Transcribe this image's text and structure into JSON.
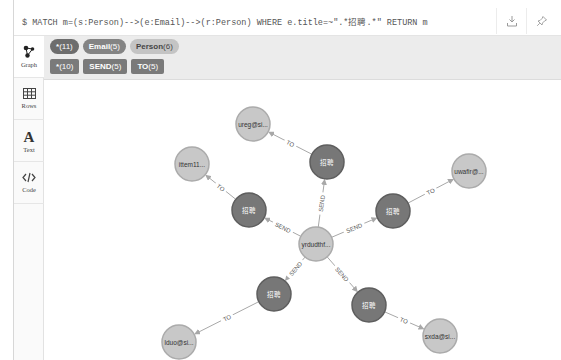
{
  "query": {
    "text": "$ MATCH m=(s:Person)-->(e:Email)-->(r:Person) WHERE e.title=~\".*招聘.*\" RETURN m",
    "buttons": [
      {
        "name": "download",
        "icon": "download-icon"
      },
      {
        "name": "pin",
        "icon": "pin-icon"
      }
    ]
  },
  "sidebar": {
    "items": [
      {
        "label": "Graph",
        "icon": "graph-icon",
        "active": true
      },
      {
        "label": "Rows",
        "icon": "table-icon",
        "active": false
      },
      {
        "label": "Text",
        "icon": "text-icon",
        "active": false
      },
      {
        "label": "Code",
        "icon": "code-icon",
        "active": false
      }
    ]
  },
  "legend": {
    "node_labels": [
      {
        "name": "*",
        "count": "(11)",
        "color": "#6d6d6d",
        "text_color": "#ffffff"
      },
      {
        "name": "Email",
        "count": "(5)",
        "color": "#848484",
        "text_color": "#ffffff"
      },
      {
        "name": "Person",
        "count": "(6)",
        "color": "#c4c4c4",
        "text_color": "#444444"
      }
    ],
    "relationship_types": [
      {
        "name": "*",
        "count": "(10)",
        "color": "#7a7a7a"
      },
      {
        "name": "SEND",
        "count": "(5)",
        "color": "#7a7a7a"
      },
      {
        "name": "TO",
        "count": "(5)",
        "color": "#7a7a7a"
      }
    ]
  },
  "graph": {
    "colors": {
      "person_fill": "#c8c8c8",
      "person_stroke": "#ababab",
      "email_fill": "#777777",
      "email_stroke": "#5e5e5e",
      "edge": "#a8a8a8"
    },
    "nodes": [
      {
        "id": "center",
        "type": "Person",
        "label": "yrdudthf...",
        "x": 272,
        "y": 164,
        "r": 17
      },
      {
        "id": "e1",
        "type": "Email",
        "label": "招聘",
        "x": 283,
        "y": 82,
        "r": 17
      },
      {
        "id": "e2",
        "type": "Email",
        "label": "招聘",
        "x": 205,
        "y": 130,
        "r": 17
      },
      {
        "id": "e3",
        "type": "Email",
        "label": "招聘",
        "x": 349,
        "y": 131,
        "r": 17
      },
      {
        "id": "e4",
        "type": "Email",
        "label": "招聘",
        "x": 230,
        "y": 214,
        "r": 17
      },
      {
        "id": "e5",
        "type": "Email",
        "label": "招聘",
        "x": 325,
        "y": 225,
        "r": 17
      },
      {
        "id": "p1",
        "type": "Person",
        "label": "ureg@si...",
        "x": 209,
        "y": 44,
        "r": 17
      },
      {
        "id": "p2",
        "type": "Person",
        "label": "ittem11...",
        "x": 148,
        "y": 84,
        "r": 17
      },
      {
        "id": "p3",
        "type": "Person",
        "label": "uwafir@...",
        "x": 425,
        "y": 91,
        "r": 17
      },
      {
        "id": "p4",
        "type": "Person",
        "label": "lduo@si...",
        "x": 135,
        "y": 262,
        "r": 17
      },
      {
        "id": "p5",
        "type": "Person",
        "label": "sxda@si...",
        "x": 396,
        "y": 256,
        "r": 17
      }
    ],
    "edges": [
      {
        "from": "center",
        "to": "e1",
        "label": "SEND"
      },
      {
        "from": "center",
        "to": "e2",
        "label": "SEND"
      },
      {
        "from": "center",
        "to": "e3",
        "label": "SEND"
      },
      {
        "from": "center",
        "to": "e4",
        "label": "SEND"
      },
      {
        "from": "center",
        "to": "e5",
        "label": "SEND"
      },
      {
        "from": "e1",
        "to": "p1",
        "label": "TO"
      },
      {
        "from": "e2",
        "to": "p2",
        "label": "TO"
      },
      {
        "from": "e3",
        "to": "p3",
        "label": "TO"
      },
      {
        "from": "e4",
        "to": "p4",
        "label": "TO"
      },
      {
        "from": "e5",
        "to": "p5",
        "label": "TO"
      }
    ]
  }
}
